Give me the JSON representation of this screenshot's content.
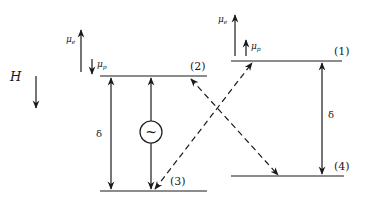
{
  "diagram": {
    "type": "energy-level diagram",
    "field": {
      "label": "H",
      "direction": "down"
    },
    "left_moments": {
      "mu_e": {
        "label": "μ",
        "sub": "e",
        "direction": "up"
      },
      "mu_p": {
        "label": "μ",
        "sub": "p",
        "direction": "down"
      }
    },
    "right_moments": {
      "mu_e": {
        "label": "μ",
        "sub": "e",
        "direction": "up"
      },
      "mu_p": {
        "label": "μ",
        "sub": "p",
        "direction": "up"
      }
    },
    "levels": [
      {
        "id": "1",
        "label": "(1)"
      },
      {
        "id": "2",
        "label": "(2)"
      },
      {
        "id": "3",
        "label": "(3)"
      },
      {
        "id": "4",
        "label": "(4)"
      }
    ],
    "gaps": {
      "left": {
        "label": "δ"
      },
      "right": {
        "label": "δ"
      }
    },
    "oscillator": {
      "symbol": "~"
    },
    "transitions": [
      {
        "from": "3",
        "to": "1",
        "style": "dashed"
      },
      {
        "from": "4",
        "to": "2",
        "style": "dashed"
      },
      {
        "from": "3",
        "to": "2",
        "style": "solid",
        "via": "oscillator"
      },
      {
        "between": [
          "2",
          "3"
        ],
        "style": "solid-double-arrow",
        "label": "δ"
      },
      {
        "between": [
          "1",
          "4"
        ],
        "style": "solid-double-arrow",
        "label": "δ"
      }
    ],
    "colors": {
      "line": "#1a1a1a",
      "background": "#ffffff"
    }
  }
}
